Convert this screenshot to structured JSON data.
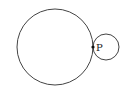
{
  "diagram": {
    "large_circle": {
      "cx": 55,
      "cy": 47,
      "r": 38,
      "stroke": "#444444"
    },
    "small_circle": {
      "cx": 106,
      "cy": 47,
      "r": 13,
      "stroke": "#444444"
    },
    "tangent_point": {
      "x": 93,
      "y": 47,
      "label": "P"
    }
  }
}
